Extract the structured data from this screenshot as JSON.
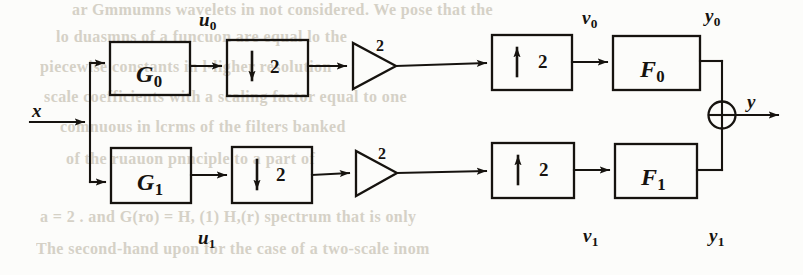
{
  "figure": {
    "background_color": "#fcfcfa",
    "ink_color": "#16130f",
    "bleed_color": "#cfcabe",
    "input": {
      "label": "x",
      "name": "input-signal"
    },
    "output": {
      "label": "y",
      "name": "output-signal"
    },
    "adder": {
      "symbol": "+",
      "name": "summing-junction"
    },
    "branches": [
      {
        "id": "upper",
        "analysis_filter": {
          "base": "G",
          "sub": "0",
          "text": "G0"
        },
        "downsampler": {
          "factor": "2",
          "arrow": "down"
        },
        "downsample_label": {
          "base": "u",
          "sub": "0",
          "text": "u0"
        },
        "amplifier": {
          "gain": "2"
        },
        "upsampler": {
          "factor": "2",
          "arrow": "up"
        },
        "upsample_label": {
          "base": "v",
          "sub": "0",
          "text": "v0"
        },
        "synthesis_filter": {
          "base": "F",
          "sub": "0",
          "text": "F0"
        },
        "branch_output_label": {
          "base": "y",
          "sub": "0",
          "text": "y0"
        }
      },
      {
        "id": "lower",
        "analysis_filter": {
          "base": "G",
          "sub": "1",
          "text": "G1"
        },
        "downsampler": {
          "factor": "2",
          "arrow": "down"
        },
        "downsample_label": {
          "base": "u",
          "sub": "1",
          "text": "u1"
        },
        "amplifier": {
          "gain": "2"
        },
        "upsampler": {
          "factor": "2",
          "arrow": "up"
        },
        "upsample_label": {
          "base": "v",
          "sub": "1",
          "text": "v1"
        },
        "synthesis_filter": {
          "base": "F",
          "sub": "1",
          "text": "F1"
        },
        "branch_output_label": {
          "base": "y",
          "sub": "1",
          "text": "y1"
        }
      }
    ]
  },
  "bleed_through_text": {
    "lines": [
      "ar Gmmumns wavelets in not considered. We pose that the",
      "lo duasmns of a funcuon are equal lo the",
      "piecewise constants in l-ligher resolution",
      "scale coefficients with a scaling factor equal to one",
      "comnuous in lcrms of the filters banked",
      "of the ruauon pnnciple to a part of",
      "a = 2 . and G(ro) = H, (1) H,(r) spectrum that is only",
      "The second-hand upon for the case of a two-scale inom"
    ]
  }
}
